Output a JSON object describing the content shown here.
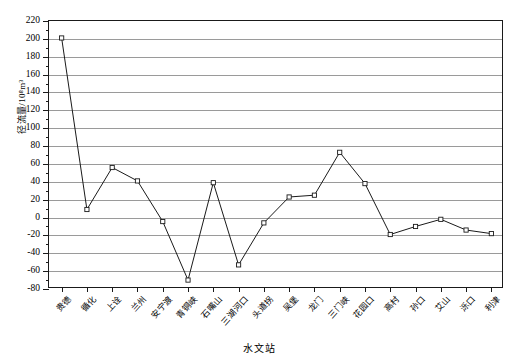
{
  "chart_data": {
    "type": "line",
    "title": "",
    "xlabel": "水文站",
    "ylabel": "径流量/10⁸m³",
    "ylim": [
      -80,
      220
    ],
    "ystep": 20,
    "grid": true,
    "legend": "none",
    "marker": "open-square",
    "categories": [
      "贵德",
      "循化",
      "上诠",
      "兰州",
      "安宁渡",
      "青铜峡",
      "石嘴山",
      "三湖河口",
      "头道拐",
      "吴堡",
      "龙门",
      "三门峡",
      "花园口",
      "高村",
      "孙口",
      "艾山",
      "泺口",
      "利津"
    ],
    "stations": [
      "贵德",
      "循化",
      "上诠",
      "兰州",
      "安宁渡",
      "青铜峡",
      "石嘴山",
      "三湖河口",
      "头道拐",
      "吴堡",
      "龙门",
      "三门峡",
      "花园口",
      "高村",
      "孙口",
      "艾山",
      "泺口",
      "利津"
    ],
    "values": [
      201,
      9,
      56,
      41,
      -4.5,
      -70,
      39,
      -53,
      -6,
      23,
      25,
      73,
      38,
      -19,
      -10,
      -2,
      -14,
      -18
    ],
    "yticks": [
      220,
      200,
      180,
      160,
      140,
      120,
      100,
      80,
      60,
      40,
      20,
      0,
      -20,
      -40,
      -60,
      -80
    ],
    "ytick_labels": [
      "220",
      "200",
      "180",
      "160",
      "140",
      "120",
      "100",
      "80",
      "60",
      "40",
      "20",
      "0",
      "-20",
      "-40",
      "-60",
      "-80"
    ],
    "series": [
      {
        "name": "径流量",
        "values": [
          201,
          9,
          56,
          41,
          -4.5,
          -70,
          39,
          -53,
          -6,
          23,
          25,
          73,
          38,
          -19,
          -10,
          -2,
          -14,
          -18
        ]
      }
    ],
    "line_color": "#1a1a1a",
    "grid_color": "#9a9a9a",
    "marker_fill": "#ffffff"
  }
}
